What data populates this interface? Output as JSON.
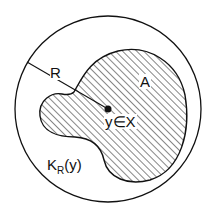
{
  "diagram": {
    "outer_circle": {
      "label": "K_R(y)",
      "center": [
        108,
        109
      ],
      "radius": 93
    },
    "region": {
      "label": "A",
      "hatched": true
    },
    "point": {
      "label": "y∈X",
      "position": [
        108,
        109
      ]
    },
    "radius_line": {
      "label": "R"
    }
  },
  "labels": {
    "R": "R",
    "A": "A",
    "point": "y∈X",
    "ball_K": "K",
    "ball_sub": "R",
    "ball_arg": "(y)"
  },
  "colors": {
    "stroke": "#111111",
    "background": "#ffffff"
  }
}
